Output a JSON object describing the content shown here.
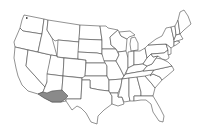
{
  "map": {
    "type": "us-states-outline",
    "highlighted_region": {
      "name": "Sonoran Desert region (southern Arizona / southeastern California)",
      "fill": "#8a8a8a"
    },
    "colors": {
      "background": "#ffffff",
      "state_fill": "#ffffff",
      "border": "#4a4a4a",
      "highlight": "#8a8a8a"
    }
  }
}
